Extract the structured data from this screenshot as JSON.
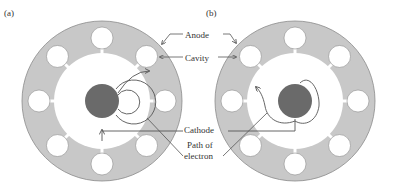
{
  "panels": [
    {
      "id": "a",
      "label": "(a)",
      "center": [
        102,
        101
      ],
      "description": "Electron path with weak magnetic field — curved arcs returning to cathode"
    },
    {
      "id": "b",
      "label": "(b)",
      "center": [
        295,
        101
      ],
      "description": "Electron path with oscillating RF field — irregular spiral path"
    }
  ],
  "labels": {
    "anode": "Anode",
    "cavity": "Cavity",
    "cathode": "Cathode",
    "path_line1": "Path of",
    "path_line2": "electron"
  },
  "colors": {
    "anode_fill": "#c8c8c8",
    "anode_stroke": "#8a8a8a",
    "cathode_fill": "#6a6a6a",
    "cavity_fill": "#ffffff",
    "line": "#555555"
  },
  "geometry": {
    "outer_radius": 80,
    "inner_radius": 48,
    "cathode_radius": 17,
    "cavity_radius": 11,
    "cavity_distance": 63,
    "cavity_count": 8
  }
}
